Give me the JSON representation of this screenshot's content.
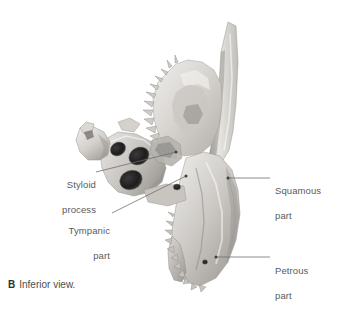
{
  "figure": {
    "caption_letter": "B",
    "caption_text": "Inferior view.",
    "background_color": "#ffffff",
    "bone_color_light": "#e3e1de",
    "bone_color_mid": "#b9b6b2",
    "bone_color_dark": "#8e8b87",
    "leader_color": "#6e6e70",
    "label_color": "#5a5a5c"
  },
  "labels": [
    {
      "id": "styloid-process",
      "line1": "Styloid",
      "line2": "process",
      "text": "Styloid process",
      "side": "left",
      "x": 44,
      "y": 166,
      "width": 52
    },
    {
      "id": "tympanic-part",
      "line1": "Tympanic",
      "line2": "part",
      "text": "Tympanic part",
      "side": "left",
      "x": 48,
      "y": 212,
      "width": 62
    },
    {
      "id": "squamous-part",
      "line1": "Squamous",
      "line2": "part",
      "text": "Squamous part",
      "side": "right",
      "x": 275,
      "y": 172,
      "width": 66
    },
    {
      "id": "petrous-part",
      "line1": "Petrous",
      "line2": "part",
      "text": "Petrous part",
      "side": "right",
      "x": 275,
      "y": 252,
      "width": 66
    }
  ],
  "leaders": [
    {
      "id": "leader-styloid",
      "from_x": 96,
      "from_y": 172,
      "to_x": 176,
      "to_y": 152
    },
    {
      "id": "leader-tympanic",
      "from_x": 112,
      "from_y": 213,
      "to_x": 186,
      "to_y": 176
    },
    {
      "id": "leader-squamous",
      "from_x": 270,
      "from_y": 178,
      "to_x": 228,
      "to_y": 178
    },
    {
      "id": "leader-petrous",
      "from_x": 270,
      "from_y": 257,
      "to_x": 216,
      "to_y": 257
    }
  ],
  "foramina": [
    {
      "id": "carotid-canal",
      "cx": 139,
      "cy": 156,
      "rx": 10.5,
      "ry": 8.5,
      "rot": -28
    },
    {
      "id": "jugular-fossa",
      "cx": 131,
      "cy": 180,
      "rx": 11.5,
      "ry": 9.5,
      "rot": -22
    },
    {
      "id": "external-acoustic-meatus",
      "cx": 118,
      "cy": 149,
      "rx": 8,
      "ry": 6.5,
      "rot": -30
    },
    {
      "id": "stylomastoid-foramen",
      "cx": 177,
      "cy": 187,
      "rx": 3.6,
      "ry": 3.0,
      "rot": 0
    },
    {
      "id": "mastoid-foramen",
      "cx": 205,
      "cy": 262,
      "rx": 2.6,
      "ry": 2.2,
      "rot": 0
    }
  ]
}
